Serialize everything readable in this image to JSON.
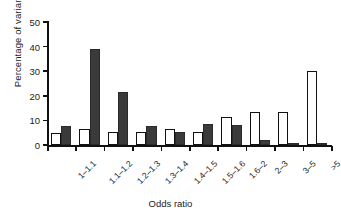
{
  "chart_data": {
    "type": "bar",
    "title": "",
    "xlabel": "Odds ratio",
    "ylabel": "Percentage of variants",
    "categories": [
      "1–1.1",
      "1.1–1.2",
      "1.2–1.3",
      "1.3–1.4",
      "1.4–1.5",
      "1.5–1.6",
      "1.6–2",
      "2–3",
      "3–5",
      ">5"
    ],
    "series": [
      {
        "name": "open",
        "color": "#ffffff",
        "values": [
          5.0,
          6.7,
          5.2,
          5.2,
          6.7,
          5.2,
          11.5,
          13.3,
          13.3,
          30.0
        ]
      },
      {
        "name": "filled",
        "color": "#3a3a3a",
        "values": [
          7.8,
          38.9,
          21.4,
          7.9,
          5.3,
          8.4,
          8.0,
          2.1,
          0.5,
          1.0
        ]
      }
    ],
    "ylim": [
      0,
      50
    ],
    "yticks": [
      0,
      10,
      20,
      30,
      40,
      50
    ],
    "ytick_labels": [
      "0",
      "10",
      "20",
      "30",
      "40",
      "50"
    ],
    "grid": false,
    "legend": "none"
  }
}
